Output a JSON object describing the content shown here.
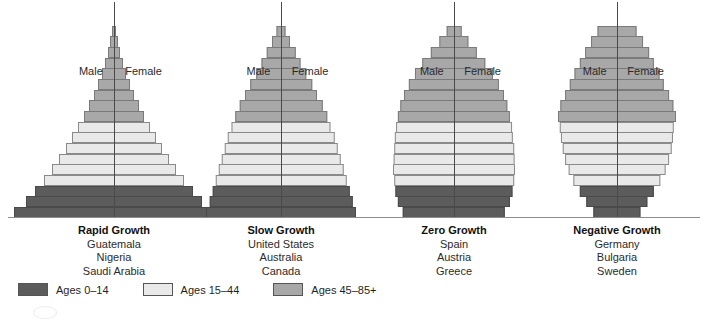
{
  "figure": {
    "male_label": "Male",
    "female_label": "Female"
  },
  "legend": {
    "items": [
      {
        "label": "Ages 0–14",
        "color": "#5c5c5c",
        "key": "young"
      },
      {
        "label": "Ages 15–44",
        "color": "#e9e9e9",
        "key": "mid"
      },
      {
        "label": "Ages 45–85+",
        "color": "#a8a8a8",
        "key": "old"
      }
    ]
  },
  "chart_data": {
    "type": "bar",
    "xlabel": "",
    "ylabel": "Age group",
    "orientation": "horizontal-diverging",
    "grid": false,
    "legend_position": "bottom-left",
    "age_groups": [
      "0-4",
      "5-9",
      "10-14",
      "15-19",
      "20-24",
      "25-29",
      "30-34",
      "35-39",
      "40-44",
      "45-49",
      "50-54",
      "55-59",
      "60-64",
      "65-69",
      "70-74",
      "75-79",
      "80-84",
      "85+"
    ],
    "age_band_of_group": [
      "young",
      "young",
      "young",
      "mid",
      "mid",
      "mid",
      "mid",
      "mid",
      "mid",
      "old",
      "old",
      "old",
      "old",
      "old",
      "old",
      "old",
      "old",
      "old"
    ],
    "panels": [
      {
        "title": "Rapid Growth",
        "countries": [
          "Guatemala",
          "Nigeria",
          "Saudi Arabia"
        ],
        "widths": [
          100,
          88,
          79,
          70,
          62,
          55,
          48,
          42,
          36,
          30,
          25,
          20,
          16,
          12,
          9,
          6,
          4,
          2
        ]
      },
      {
        "title": "Slow Growth",
        "countries": [
          "United States",
          "Australia",
          "Canada"
        ],
        "widths": [
          100,
          95,
          91,
          87,
          83,
          79,
          75,
          71,
          66,
          61,
          55,
          48,
          41,
          33,
          26,
          19,
          12,
          6
        ]
      },
      {
        "title": "Zero Growth",
        "countries": [
          "Spain",
          "Austria",
          "Greece"
        ],
        "widths": [
          84,
          92,
          96,
          98,
          100,
          99,
          98,
          97,
          95,
          92,
          88,
          82,
          74,
          64,
          52,
          38,
          24,
          12
        ]
      },
      {
        "title": "Negative Growth",
        "countries": [
          "Germany",
          "Bulgaria",
          "Sweden"
        ],
        "widths": [
          40,
          52,
          63,
          74,
          82,
          88,
          92,
          95,
          97,
          100,
          96,
          88,
          80,
          72,
          63,
          54,
          44,
          33
        ]
      }
    ]
  }
}
